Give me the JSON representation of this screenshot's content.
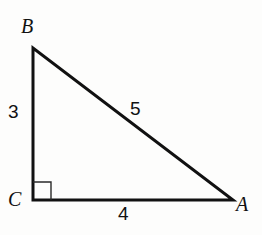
{
  "figure": {
    "kind": "right-triangle-diagram",
    "background_color": "#fdfdfc",
    "stroke_color": "#111111",
    "stroke_width": 3,
    "vertices": [
      {
        "name": "B",
        "label": "B",
        "x": 33,
        "y": 48
      },
      {
        "name": "C",
        "label": "C",
        "x": 33,
        "y": 200
      },
      {
        "name": "A",
        "label": "A",
        "x": 233,
        "y": 200
      }
    ],
    "right_angle": {
      "at_vertex": "C",
      "marker": "square",
      "size": 18,
      "stroke_color": "#2a2a2a",
      "stroke_width": 1.4
    },
    "sides": [
      {
        "name": "leg-BC",
        "from": "B",
        "to": "C",
        "length_label": "3"
      },
      {
        "name": "leg-CA",
        "from": "C",
        "to": "A",
        "length_label": "4"
      },
      {
        "name": "hypotenuse-BA",
        "from": "B",
        "to": "A",
        "length_label": "5"
      }
    ],
    "labels": {
      "vertex_b": "B",
      "vertex_c": "C",
      "vertex_a": "A",
      "leg_vertical": "3",
      "leg_horizontal": "4",
      "hypotenuse": "5"
    }
  }
}
